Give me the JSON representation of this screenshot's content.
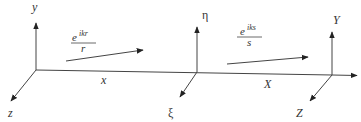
{
  "diagram": {
    "type": "coordinate-frames",
    "line_color": "#333333",
    "background": "#ffffff",
    "frames": [
      {
        "name": "source",
        "axes": {
          "vertical": "y",
          "horizontal": "x",
          "depth": "z"
        }
      },
      {
        "name": "intermediate",
        "axes": {
          "vertical": "η",
          "depth": "ξ"
        }
      },
      {
        "name": "observer",
        "axes": {
          "vertical": "Y",
          "horizontal": "X",
          "depth": "Z"
        }
      }
    ],
    "labels": {
      "y": "y",
      "x": "x",
      "z": "z",
      "eta": "η",
      "xi": "ξ",
      "Y": "Y",
      "X": "X",
      "Z": "Z"
    },
    "waves": [
      {
        "name": "first-wave",
        "numerator_base": "e",
        "numerator_exp": "ikr",
        "denominator": "r"
      },
      {
        "name": "second-wave",
        "numerator_base": "e",
        "numerator_exp": "iks",
        "denominator": "s"
      }
    ]
  }
}
